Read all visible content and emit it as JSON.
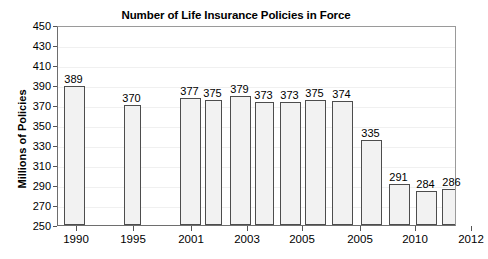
{
  "chart_data": {
    "type": "bar",
    "title": "Number of Life Insurance Policies in Force",
    "xlabel": "",
    "ylabel": "Millions of Policies",
    "ylim": [
      250,
      450
    ],
    "ytick_step": 20,
    "yticks": [
      450,
      430,
      410,
      390,
      370,
      350,
      330,
      310,
      290,
      270,
      250
    ],
    "grid": true,
    "legend": "none",
    "categories": [
      "1990",
      "1995",
      "2001",
      "2002",
      "2003",
      "2004",
      "2005",
      "2006",
      "2007",
      "2008",
      "2010",
      "2011",
      "2012"
    ],
    "xtick_labels": [
      "1990",
      "1995",
      "2001",
      "2003",
      "2005",
      "2005",
      "2010",
      "2012"
    ],
    "values": [
      389,
      370,
      377,
      375,
      379,
      373,
      373,
      375,
      374,
      335,
      291,
      284,
      286
    ],
    "data_labels": [
      "389",
      "370",
      "377",
      "375",
      "379",
      "373",
      "373",
      "375",
      "374",
      "335",
      "291",
      "284",
      "286"
    ],
    "bar_fill_color": "#f2f2f2",
    "bar_border_color": "#4d4d4d",
    "axis_color": "#6e6e6e",
    "gridline_color": "#f0f0f0",
    "text_color": "#000000"
  },
  "bars": [
    {
      "label": "389",
      "value": 389,
      "x": 6,
      "width": 21
    },
    {
      "label": "370",
      "value": 370,
      "x": 66,
      "width": 17
    },
    {
      "label": "377",
      "value": 377,
      "x": 122,
      "width": 21
    },
    {
      "label": "375",
      "value": 375,
      "x": 147,
      "width": 17
    },
    {
      "label": "379",
      "value": 379,
      "x": 172,
      "width": 21
    },
    {
      "label": "373",
      "value": 373,
      "x": 197,
      "width": 19
    },
    {
      "label": "373",
      "value": 373,
      "x": 222,
      "width": 21
    },
    {
      "label": "375",
      "value": 375,
      "x": 247,
      "width": 21
    },
    {
      "label": "374",
      "value": 374,
      "x": 274,
      "width": 21
    },
    {
      "label": "335",
      "value": 335,
      "x": 303,
      "width": 21
    },
    {
      "label": "291",
      "value": 291,
      "x": 331,
      "width": 21
    },
    {
      "label": "284",
      "value": 284,
      "x": 358,
      "width": 21
    },
    {
      "label": "286",
      "value": 286,
      "x": 384,
      "width": 21
    }
  ],
  "x_ticks": [
    {
      "label": "1990",
      "x": 19
    },
    {
      "label": "1995",
      "x": 76
    },
    {
      "label": "2001",
      "x": 134
    },
    {
      "label": "2003",
      "x": 190
    },
    {
      "label": "2005",
      "x": 245
    },
    {
      "label": "2005",
      "x": 303
    },
    {
      "label": "2010",
      "x": 358
    },
    {
      "label": "2012",
      "x": 414
    }
  ]
}
